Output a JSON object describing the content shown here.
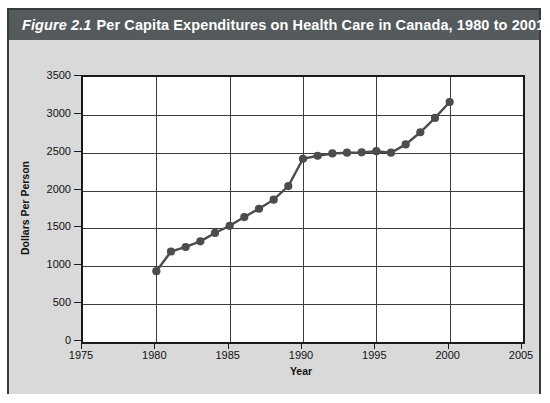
{
  "figure": {
    "number_label": "Figure  2.1",
    "title": "Per Capita Expenditures on Health Care in Canada, 1980 to 2001",
    "header_bg": "#555a5c",
    "card_bg": "#d9d9d9",
    "plot_bg": "#ffffff",
    "series_color": "#4c4c4c"
  },
  "chart_data": {
    "type": "line",
    "title": "Per Capita Expenditures on Health Care in Canada, 1980 to 2001",
    "xlabel": "Year",
    "ylabel": "Dollars Per Person",
    "xlim": [
      1975,
      2005
    ],
    "ylim": [
      0,
      3500
    ],
    "xticks": [
      1975,
      1980,
      1985,
      1990,
      1995,
      2000,
      2005
    ],
    "yticks": [
      0,
      500,
      1000,
      1500,
      2000,
      2500,
      3000,
      3500
    ],
    "grid": true,
    "legend": "none",
    "markers": "filled-circle",
    "x": [
      1980,
      1981,
      1982,
      1983,
      1984,
      1985,
      1986,
      1987,
      1988,
      1989,
      1990,
      1991,
      1992,
      1993,
      1994,
      1995,
      1996,
      1997,
      1998,
      1999,
      2000
    ],
    "values": [
      935,
      1195,
      1255,
      1330,
      1440,
      1535,
      1650,
      1760,
      1880,
      2060,
      2420,
      2460,
      2490,
      2500,
      2505,
      2520,
      2500,
      2610,
      2770,
      2960,
      3170
    ],
    "series": [
      {
        "name": "Per capita health expenditure",
        "values": [
          935,
          1195,
          1255,
          1330,
          1440,
          1535,
          1650,
          1760,
          1880,
          2060,
          2420,
          2460,
          2490,
          2500,
          2505,
          2520,
          2500,
          2610,
          2770,
          2960,
          3170
        ]
      }
    ]
  }
}
